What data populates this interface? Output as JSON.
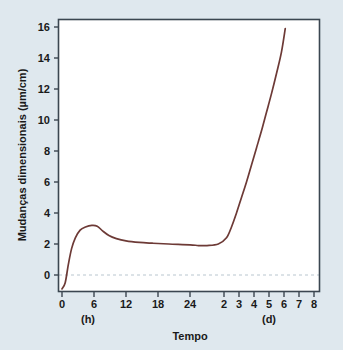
{
  "figure": {
    "background_color": "#dfe8ee",
    "plot_background_color": "#ffffff",
    "frame_color": "#3b4650",
    "curve_color": "#6d3a36",
    "zero_line_color": "#b9c6cf"
  },
  "chart_data": {
    "type": "line",
    "title": "",
    "subtitle": "",
    "xlabel": "Tempo",
    "ylabel": "Mudanças dimensionais (µm/cm)",
    "x_unit_left": "(h)",
    "x_unit_right": "(d)",
    "grid": false,
    "legend": null,
    "ylim": [
      -1.2,
      17.0
    ],
    "y_ticks": [
      0,
      2,
      4,
      6,
      8,
      10,
      12,
      14,
      16
    ],
    "y_tick_labels": [
      "0",
      "2",
      "4",
      "6",
      "8",
      "10",
      "12",
      "14",
      "16"
    ],
    "x_ticks_hours": [
      0,
      6,
      12,
      18,
      24
    ],
    "x_tick_labels_hours": [
      "0",
      "6",
      "12",
      "18",
      "24"
    ],
    "x_ticks_days": [
      2,
      3,
      4,
      5,
      6,
      7,
      8
    ],
    "x_tick_labels_days": [
      "2",
      "3",
      "4",
      "5",
      "6",
      "7",
      "8"
    ],
    "x_axis_note": "Eixo composto: horas de 0 a 24, depois dias de 2 a 8",
    "zero_reference_line": 0,
    "series": [
      {
        "name": "Mudanças dimensionais",
        "color": "#6d3a36",
        "points": [
          [
            0.0,
            -0.9
          ],
          [
            0.6,
            -0.5
          ],
          [
            1.2,
            0.7
          ],
          [
            1.8,
            1.7
          ],
          [
            2.5,
            2.4
          ],
          [
            3.4,
            2.9
          ],
          [
            4.4,
            3.1
          ],
          [
            5.6,
            3.2
          ],
          [
            6.6,
            3.15
          ],
          [
            7.6,
            2.85
          ],
          [
            8.8,
            2.55
          ],
          [
            10.2,
            2.35
          ],
          [
            12.0,
            2.2
          ],
          [
            14.5,
            2.1
          ],
          [
            17.0,
            2.05
          ],
          [
            20.0,
            2.0
          ],
          [
            24.0,
            1.95
          ],
          [
            30.0,
            1.9
          ],
          [
            36.0,
            1.9
          ],
          [
            44.0,
            2.0
          ],
          [
            52.0,
            2.4
          ],
          [
            60.0,
            3.1
          ],
          [
            68.0,
            4.0
          ],
          [
            76.0,
            5.0
          ],
          [
            84.0,
            6.0
          ],
          [
            92.0,
            7.1
          ],
          [
            100.0,
            8.2
          ],
          [
            108.0,
            9.3
          ],
          [
            116.0,
            10.5
          ],
          [
            124.0,
            11.7
          ],
          [
            132.0,
            13.0
          ],
          [
            140.0,
            14.4
          ],
          [
            146.0,
            15.9
          ]
        ]
      }
    ]
  }
}
